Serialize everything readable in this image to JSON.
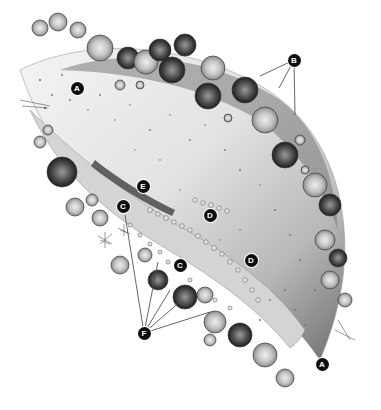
{
  "diagram": {
    "style": "grayscale pencil illustration",
    "colors": {
      "background": "#ffffff",
      "callout_fill": "#0d0d0d",
      "callout_text": "#ffffff",
      "leader_line": "#555555",
      "bed_dark": "#5a5a5a",
      "bed_light": "#eeeeee",
      "rosette_light": "#bdbdbd",
      "rosette_dark": "#4a4a4a"
    },
    "callouts": [
      {
        "id": "A1",
        "letter": "A",
        "x": 77,
        "y": 88
      },
      {
        "id": "A2",
        "letter": "A",
        "x": 322,
        "y": 364
      },
      {
        "id": "B",
        "letter": "B",
        "x": 294,
        "y": 60
      },
      {
        "id": "C1",
        "letter": "C",
        "x": 123,
        "y": 206
      },
      {
        "id": "C2",
        "letter": "C",
        "x": 180,
        "y": 265
      },
      {
        "id": "D1",
        "letter": "D",
        "x": 210,
        "y": 215
      },
      {
        "id": "D2",
        "letter": "D",
        "x": 251,
        "y": 260
      },
      {
        "id": "E",
        "letter": "E",
        "x": 143,
        "y": 186
      },
      {
        "id": "F",
        "letter": "F",
        "x": 144,
        "y": 333
      }
    ],
    "leaders": {
      "B": [
        [
          294,
          60,
          260,
          76
        ],
        [
          294,
          60,
          279,
          88
        ],
        [
          294,
          60,
          295,
          115
        ]
      ],
      "F": [
        [
          144,
          333,
          125,
          215
        ],
        [
          144,
          333,
          158,
          262
        ],
        [
          144,
          333,
          170,
          290
        ],
        [
          144,
          333,
          182,
          300
        ],
        [
          144,
          333,
          210,
          312
        ]
      ]
    }
  }
}
